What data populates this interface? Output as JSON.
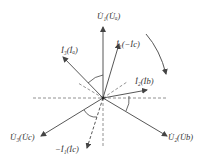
{
  "diagram": {
    "type": "phasor-diagram",
    "center": [
      103,
      98
    ],
    "colors": {
      "stroke": "#444444",
      "dashed": "#666666",
      "text": "#333333"
    },
    "phasors": [
      {
        "id": "U1",
        "label": "U̇₁(U̇ₐ)",
        "end": [
          103,
          27
        ],
        "style": "solid"
      },
      {
        "id": "I1",
        "label": "İ₁(−İc)",
        "end": [
          119,
          44
        ],
        "style": "solid"
      },
      {
        "id": "I3",
        "label": "İ₃(İₐ)",
        "end": [
          63,
          57
        ],
        "style": "solid"
      },
      {
        "id": "I2",
        "label": "İ₂(İb)",
        "end": [
          147,
          90
        ],
        "style": "solid"
      },
      {
        "id": "U2",
        "label": "U̇₂(U̇b)",
        "end": [
          167,
          136
        ],
        "style": "solid"
      },
      {
        "id": "U3",
        "label": "U̇₃(U̇c)",
        "end": [
          41,
          136
        ],
        "style": "solid"
      },
      {
        "id": "negI1",
        "label": "−İ₁(İc)",
        "end": [
          87,
          148
        ],
        "style": "dashed"
      }
    ],
    "labels": {
      "U1": "U̇₁(U̇ₐ)",
      "I1": "İ₁(−İc)",
      "I3": "İ₃(İₐ)",
      "I2": "İ₂(İb)",
      "U2": "U̇₂(U̇b)",
      "U3": "U̇₃(U̇c)",
      "negI1": "−İ₁(İc)"
    },
    "rotation_arrow": "clockwise"
  }
}
